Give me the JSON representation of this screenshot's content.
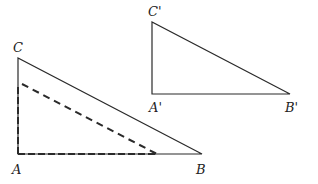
{
  "diagram": {
    "type": "geometry",
    "colors": {
      "line": "#2a2a2a",
      "background": "#ffffff"
    },
    "triangle_ABC": {
      "vertices": {
        "A": {
          "label": "A",
          "x": 18,
          "y": 154
        },
        "B": {
          "label": "B",
          "x": 202,
          "y": 154
        },
        "C": {
          "label": "C",
          "x": 18,
          "y": 58
        }
      },
      "right_angle_at": "A",
      "style": "solid"
    },
    "triangle_dashed": {
      "vertices": {
        "A": {
          "x": 18,
          "y": 154
        },
        "B": {
          "x": 157,
          "y": 154
        },
        "C": {
          "x": 22,
          "y": 84
        }
      },
      "style": "dashed"
    },
    "triangle_A1B1C1": {
      "vertices": {
        "A1": {
          "label": "A'",
          "x": 152,
          "y": 94
        },
        "B1": {
          "label": "B'",
          "x": 290,
          "y": 94
        },
        "C1": {
          "label": "C'",
          "x": 152,
          "y": 22
        }
      },
      "right_angle_at": "A'",
      "style": "solid"
    }
  }
}
